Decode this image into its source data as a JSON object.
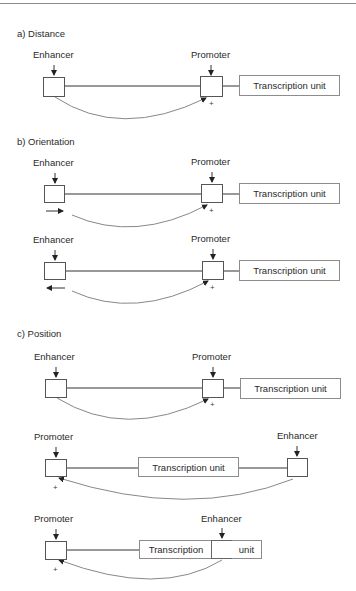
{
  "sections": {
    "a": {
      "title": "a) Distance",
      "row1": {
        "enhancer_label": "Enhancer",
        "promoter_label": "Promoter",
        "tu_label": "Transcription unit",
        "sign": "+"
      }
    },
    "b": {
      "title": "b) Orientation",
      "row1": {
        "enhancer_label": "Enhancer",
        "promoter_label": "Promoter",
        "tu_label": "Transcription unit",
        "sign": "+",
        "orientation": "forward"
      },
      "row2": {
        "enhancer_label": "Enhancer",
        "promoter_label": "Promoter",
        "tu_label": "Transcription unit",
        "sign": "+",
        "orientation": "reverse"
      }
    },
    "c": {
      "title": "c) Position",
      "row1": {
        "enhancer_label": "Enhancer",
        "promoter_label": "Promoter",
        "tu_label": "Transcription unit",
        "sign": "+",
        "placement": "upstream"
      },
      "row2": {
        "promoter_label": "Promoter",
        "enhancer_label": "Enhancer",
        "tu_label": "Transcription unit",
        "sign": "+",
        "placement": "downstream"
      },
      "row3": {
        "promoter_label": "Promoter",
        "enhancer_label": "Enhancer",
        "tu_part1": "Transcription",
        "tu_part2": "unit",
        "sign": "+",
        "placement": "within transcription unit"
      }
    }
  },
  "colors": {
    "line": "#333333",
    "arc": "#888888",
    "box_border": "#555555",
    "tu_border": "#8c8c8c"
  }
}
